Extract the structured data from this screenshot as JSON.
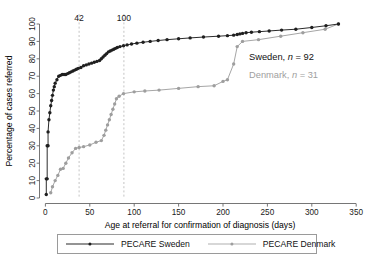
{
  "chart_data": {
    "type": "line",
    "title": "",
    "xlabel": "Age at referral for confirmation of diagnosis (days)",
    "ylabel": "Percentage of cases referred",
    "xlim": [
      -8,
      352
    ],
    "ylim": [
      0,
      100
    ],
    "xticks": [
      0,
      50,
      100,
      150,
      200,
      250,
      300,
      350
    ],
    "yticks": [
      0,
      10,
      20,
      30,
      40,
      50,
      60,
      70,
      80,
      90,
      100
    ],
    "xticklabels": [
      "0",
      "50",
      "100",
      "150",
      "200",
      "250",
      "300",
      "350"
    ],
    "yticklabels": [
      "0",
      "10",
      "20",
      "30",
      "40",
      "50",
      "60",
      "70",
      "80",
      "90",
      "100"
    ],
    "grid": false,
    "legend_position": "bottom",
    "reference_lines": [
      {
        "name": "ref-42",
        "x": 42,
        "label": "42",
        "style": "dashed",
        "color": "#bdbdbd"
      },
      {
        "name": "ref-100",
        "x": 100,
        "label": "100",
        "style": "dashed",
        "color": "#bdbdbd"
      }
    ],
    "annotations": [
      {
        "name": "sweden-n",
        "text_before": "Sweden, ",
        "text_italic": "n",
        "text_after": " = 92",
        "color": "#111111"
      },
      {
        "name": "denmark-n",
        "text_before": "Denmark, ",
        "text_italic": "n",
        "text_after": " = 31",
        "color": "#a0a0a0"
      }
    ],
    "series": [
      {
        "name": "PECARE Sweden",
        "color": "#2b2b2b",
        "marker": "filled-circle",
        "n": 92,
        "x": [
          1,
          1,
          2,
          2,
          3,
          3,
          4,
          5,
          6,
          7,
          8,
          9,
          10,
          11,
          13,
          15,
          17,
          19,
          21,
          23,
          25,
          27,
          29,
          31,
          33,
          35,
          37,
          40,
          43,
          46,
          49,
          52,
          55,
          58,
          61,
          63,
          65,
          67,
          69,
          71,
          73,
          75,
          77,
          79,
          81,
          84,
          88,
          92,
          97,
          103,
          110,
          118,
          127,
          137,
          150,
          163,
          178,
          195,
          205,
          212,
          216,
          219,
          222,
          226,
          232,
          241,
          252,
          266,
          282,
          300,
          316,
          330
        ],
        "y": [
          2,
          11,
          11,
          30,
          30,
          38,
          45,
          49,
          53,
          56,
          59,
          62,
          64,
          66,
          68,
          70,
          70.5,
          71,
          71,
          71,
          71.5,
          72,
          72.5,
          73,
          73.5,
          74,
          74.5,
          75,
          76,
          76.5,
          77,
          77.5,
          78,
          78.5,
          79,
          80,
          81,
          82,
          83,
          84,
          84.5,
          85,
          85.5,
          86,
          86.5,
          87,
          87.5,
          88,
          88.5,
          89,
          89.5,
          90,
          90.5,
          91,
          91.5,
          92,
          92.5,
          93,
          93.3,
          93.6,
          94,
          94.3,
          94.6,
          95,
          95.3,
          95.6,
          96,
          96.5,
          97,
          98,
          99,
          100
        ]
      },
      {
        "name": "PECARE Denmark",
        "color": "#a6a6a6",
        "marker": "open-circle",
        "n": 31,
        "x": [
          6,
          8,
          11,
          14,
          17,
          20,
          23,
          26,
          30,
          34,
          38,
          43,
          50,
          57,
          63,
          66,
          68,
          70,
          72,
          74,
          76,
          78,
          80,
          83,
          88,
          100,
          112,
          128,
          150,
          172,
          190,
          200,
          205,
          212,
          216,
          222,
          240,
          265,
          290,
          315,
          330
        ],
        "y": [
          3,
          6.5,
          10,
          13,
          16.5,
          17,
          20,
          23,
          26,
          28.5,
          29,
          29.5,
          30.5,
          32,
          33,
          36,
          39,
          42,
          45,
          48,
          51,
          54,
          57,
          58.5,
          60,
          61,
          61.5,
          62,
          63,
          64,
          64.5,
          67,
          68,
          77,
          87,
          90,
          91,
          93,
          95,
          97,
          100
        ]
      }
    ]
  },
  "legend": {
    "items": [
      {
        "name": "legend-sweden",
        "label": "PECARE Sweden",
        "color": "#2b2b2b"
      },
      {
        "name": "legend-denmark",
        "label": "PECARE Denmark",
        "color": "#a6a6a6"
      }
    ]
  },
  "axis": {
    "x_title": "Age at referral for confirmation of diagnosis (days)",
    "y_title": "Percentage of cases referred"
  }
}
